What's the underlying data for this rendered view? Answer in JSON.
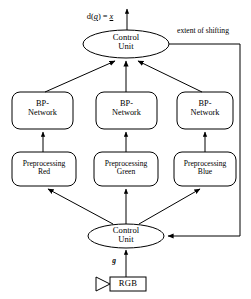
{
  "diagram": {
    "output_label": "d(g) = x",
    "output_label_parts": {
      "prefix": "d(",
      "arg": "g",
      "middle": ") = ",
      "result": "x"
    },
    "feedback_label": "extent of shifting",
    "input_signal_label": "g",
    "top_control_unit": {
      "line1": "Control",
      "line2": "Unit"
    },
    "bottom_control_unit": {
      "line1": "Control",
      "line2": "Unit"
    },
    "networks": [
      {
        "line1": "BP-",
        "line2": "Network"
      },
      {
        "line1": "BP-",
        "line2": "Network"
      },
      {
        "line1": "BP-",
        "line2": "Network"
      }
    ],
    "preprocessors": [
      {
        "line1": "Preprocessing",
        "line2": "Red"
      },
      {
        "line1": "Preprocessing",
        "line2": "Green"
      },
      {
        "line1": "Preprocessing",
        "line2": "Blue"
      }
    ],
    "source": {
      "label": "RGB",
      "icon": "play-triangle-icon"
    },
    "colors": {
      "stroke": "#000000",
      "fill": "#ffffff",
      "text": "#000000"
    }
  }
}
